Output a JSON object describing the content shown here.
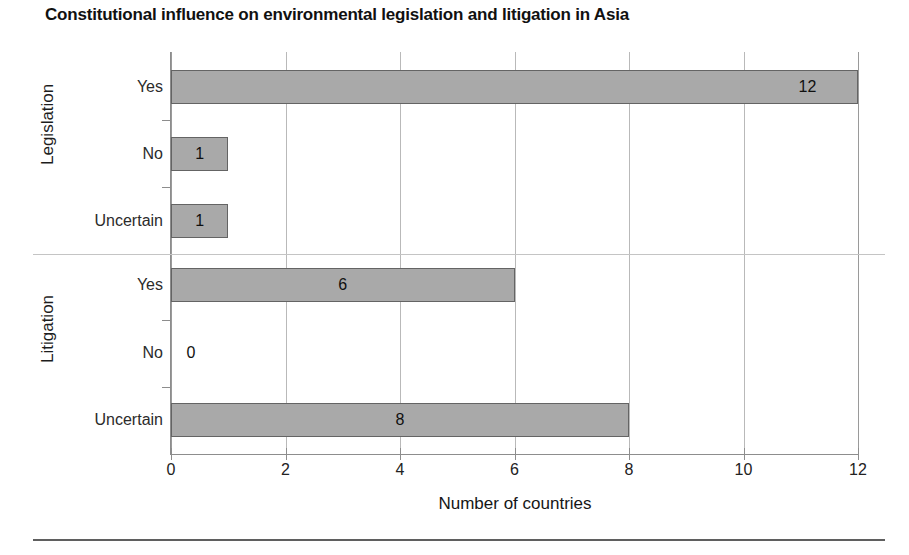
{
  "chart_data": {
    "type": "bar",
    "orientation": "horizontal",
    "title": "Constitutional influence on environmental legislation and litigation in Asia",
    "xlabel": "Number of countries",
    "ylabel": "",
    "xlim": [
      0,
      12
    ],
    "xticks": [
      0,
      2,
      4,
      6,
      8,
      10,
      12
    ],
    "xtick_labels": [
      "0",
      "2",
      "4",
      "6",
      "8",
      "10",
      "12"
    ],
    "grid": true,
    "grid_axis": "x",
    "legend": false,
    "groups": [
      {
        "name": "Legislation",
        "categories": [
          "Yes",
          "No",
          "Uncertain"
        ],
        "values": [
          12,
          1,
          1
        ],
        "value_labels": [
          "12",
          "1",
          "1"
        ]
      },
      {
        "name": "Litigation",
        "categories": [
          "Yes",
          "No",
          "Uncertain"
        ],
        "values": [
          6,
          0,
          8
        ],
        "value_labels": [
          "6",
          "0",
          "8"
        ]
      }
    ],
    "categories": [
      "Legislation - Yes",
      "Legislation - No",
      "Legislation - Uncertain",
      "Litigation - Yes",
      "Litigation - No",
      "Litigation - Uncertain"
    ],
    "values": [
      12,
      1,
      1,
      6,
      0,
      8
    ],
    "colors": {
      "bar_fill": "#a9a9a9",
      "bar_border": "#646464",
      "gridline": "#b9b9b9",
      "axis": "#8d8d8d",
      "text": "#1a1a1a",
      "background": "#ffffff",
      "separator": "#c4c4c4",
      "bottom_rule": "#5f5f5f"
    }
  },
  "bars": [
    {
      "label": "12",
      "value": 12,
      "category": "Yes",
      "group": "Legislation",
      "top": 70,
      "height": 34,
      "label_inside": true
    },
    {
      "label": "1",
      "value": 1,
      "category": "No",
      "group": "Legislation",
      "top": 137,
      "height": 34,
      "label_inside": true
    },
    {
      "label": "1",
      "value": 1,
      "category": "Uncertain",
      "group": "Legislation",
      "top": 204,
      "height": 34,
      "label_inside": true
    },
    {
      "label": "6",
      "value": 6,
      "category": "Yes",
      "group": "Litigation",
      "top": 268,
      "height": 34,
      "label_inside": true
    },
    {
      "label": "0",
      "value": 0,
      "category": "No",
      "group": "Litigation",
      "top": 336,
      "height": 34,
      "label_inside": false
    },
    {
      "label": "8",
      "value": 8,
      "category": "Uncertain",
      "group": "Litigation",
      "top": 403,
      "height": 34,
      "label_inside": true
    }
  ],
  "category_labels": [
    {
      "text": "Yes",
      "y": 87
    },
    {
      "text": "No",
      "y": 154
    },
    {
      "text": "Uncertain",
      "y": 221
    },
    {
      "text": "Yes",
      "y": 285
    },
    {
      "text": "No",
      "y": 353
    },
    {
      "text": "Uncertain",
      "y": 420
    }
  ],
  "group_labels": [
    {
      "text": "Legislation",
      "center_y": 155
    },
    {
      "text": "Litigation",
      "center_y": 353
    }
  ],
  "xticks": [
    {
      "label": "0",
      "value": 0
    },
    {
      "label": "2",
      "value": 2
    },
    {
      "label": "4",
      "value": 4
    },
    {
      "label": "6",
      "value": 6
    },
    {
      "label": "8",
      "value": 8
    },
    {
      "label": "10",
      "value": 10
    },
    {
      "label": "12",
      "value": 12
    }
  ],
  "yticks_y": [
    120,
    187,
    320,
    387
  ]
}
